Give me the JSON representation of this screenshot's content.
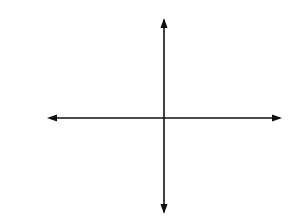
{
  "problem": {
    "number": "9."
  },
  "chart_data": {
    "type": "step",
    "title": "",
    "xlabel": "x",
    "ylabel": "y",
    "xlim": [
      -5,
      5
    ],
    "ylim": [
      -4,
      4
    ],
    "grid": true,
    "tick_labels": [
      {
        "axis": "y",
        "value": 1,
        "text": "1"
      },
      {
        "axis": "x",
        "value": -2,
        "text": "−2"
      }
    ],
    "segments": [
      {
        "y": -3,
        "x_start": -3,
        "x_end": -2.5,
        "start": "closed",
        "end": "closed"
      },
      {
        "y": -2,
        "x_start": -2.5,
        "x_end": -1.5,
        "start": "open",
        "end": "closed"
      },
      {
        "y": -1,
        "x_start": -1.5,
        "x_end": -0.5,
        "start": "open",
        "end": "closed"
      },
      {
        "y": 0,
        "x_start": -0.5,
        "x_end": 0.5,
        "start": "open",
        "end": "open"
      },
      {
        "y": 1,
        "x_start": 0.5,
        "x_end": 1.5,
        "start": "closed",
        "end": "open"
      },
      {
        "y": 2,
        "x_start": 1.5,
        "x_end": 2.5,
        "start": "closed",
        "end": "open"
      },
      {
        "y": 3,
        "x_start": 2.5,
        "x_end": 3,
        "start": "closed",
        "end": "closed"
      }
    ]
  }
}
